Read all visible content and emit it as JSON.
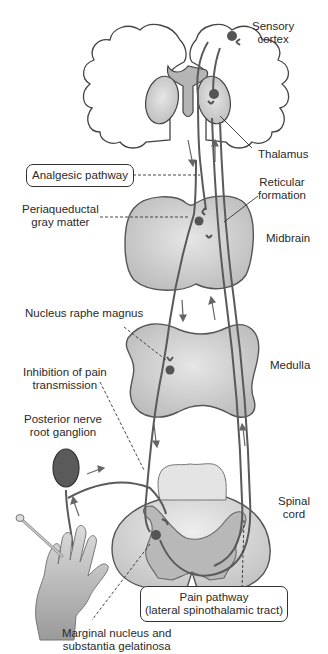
{
  "diagram": {
    "type": "neuroanatomy-pathway",
    "colors": {
      "pathway_line": "#5a5a5a",
      "tissue_fill": "#cfcfcf",
      "tissue_stroke": "#555555",
      "neuron_body": "#555555",
      "ganglion": "#5a5a5a",
      "leader_line": "#333333"
    },
    "structures": {
      "sensory_cortex": "Sensory\ncortex",
      "sensory_cortex_l1": "Sensory",
      "sensory_cortex_l2": "cortex",
      "thalamus": "Thalamus",
      "reticular_formation_l1": "Reticular",
      "reticular_formation_l2": "formation",
      "midbrain": "Midbrain",
      "periaqueductal_l1": "Periaqueductal",
      "periaqueductal_l2": "gray matter",
      "nucleus_raphe_magnus": "Nucleus raphe magnus",
      "medulla": "Medulla",
      "inhibition_l1": "Inhibition of pain",
      "inhibition_l2": "transmission",
      "ganglion_l1": "Posterior nerve",
      "ganglion_l2": "root ganglion",
      "spinal_cord_l1": "Spinal",
      "spinal_cord_l2": "cord",
      "marginal_l1": "Marginal nucleus and",
      "marginal_l2": "substantia gelatinosa"
    },
    "boxes": {
      "analgesic_pathway": "Analgesic pathway",
      "pain_pathway_l1": "Pain pathway",
      "pain_pathway_l2": "(lateral spinothalamic tract)"
    }
  }
}
